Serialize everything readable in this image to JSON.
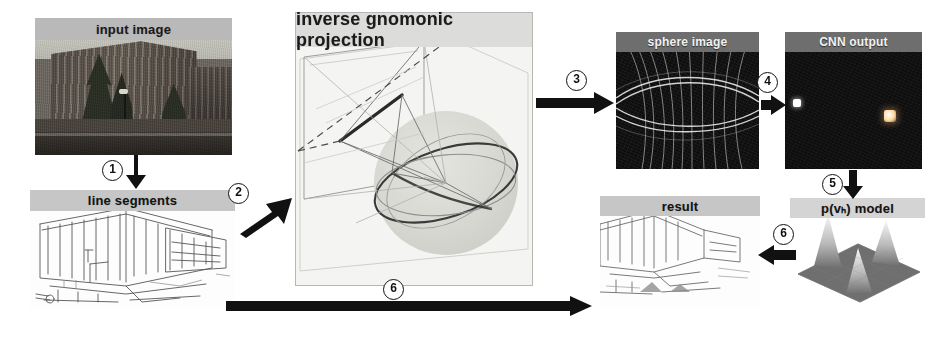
{
  "figure": {
    "type": "pipeline-diagram",
    "background_color": "#ffffff",
    "panels": [
      {
        "id": "input-image",
        "caption": "input image",
        "kind": "photograph",
        "subject": "brick university building with conifer trees and a lamp post",
        "x": 35,
        "y": 18,
        "w": 197,
        "h": 137,
        "caption_band_color": "#b9b9b9",
        "caption_band_height": 22
      },
      {
        "id": "line-segments",
        "caption": "line segments",
        "kind": "line-drawing",
        "subject": "extracted edge / line-segment map of the building",
        "x": 30,
        "y": 190,
        "w": 205,
        "h": 118,
        "caption_band_color": "#c6c6c6",
        "caption_band_height": 21
      },
      {
        "id": "inverse-gnomonic-projection",
        "caption": "inverse gnomonic projection",
        "kind": "3d-geometry",
        "subject": "image plane, projection rays, great circles on the unit sphere",
        "x": 295,
        "y": 12,
        "w": 236,
        "h": 272,
        "caption_band_color": "#dcdcda",
        "caption_band_height": 34
      },
      {
        "id": "sphere-image",
        "caption": "sphere image",
        "kind": "dark-raster",
        "subject": "great-circle traces rendered on an equirectangular sphere image",
        "x": 616,
        "y": 32,
        "w": 143,
        "h": 137,
        "caption_band_color": "#6e6e6e",
        "caption_band_height": 20
      },
      {
        "id": "cnn-output",
        "caption": "CNN output",
        "kind": "dark-raster",
        "subject": "sparse activation heat map with two bright response blobs",
        "x": 785,
        "y": 32,
        "w": 137,
        "h": 137,
        "caption_band_color": "#6e6e6e",
        "caption_band_height": 20,
        "hotspots": [
          {
            "label": "left-response",
            "x": 0.06,
            "y": 0.49,
            "w": 0.055,
            "h": 0.06,
            "color": "#ffffff"
          },
          {
            "label": "right-response",
            "x": 0.72,
            "y": 0.57,
            "w": 0.085,
            "h": 0.085,
            "color": "#ffd8a0"
          }
        ]
      },
      {
        "id": "pvh-model",
        "caption": "p(vₕ) model",
        "kind": "surface-plot",
        "subject": "3-D probability density surface with three gaussian peaks",
        "x": 790,
        "y": 198,
        "w": 135,
        "h": 110,
        "caption_band_color": "#d4d4d4",
        "caption_band_height": 20,
        "peaks": 3
      },
      {
        "id": "result",
        "caption": "result",
        "kind": "line-drawing",
        "subject": "line segments coloured by assigned vanishing point",
        "x": 600,
        "y": 196,
        "w": 160,
        "h": 112,
        "caption_band_color": "#c6c6c6",
        "caption_band_height": 20
      }
    ],
    "steps": [
      {
        "n": "①",
        "label": "1",
        "from": "input-image",
        "to": "line-segments",
        "direction": "down",
        "badge_x": 112,
        "badge_y": 160
      },
      {
        "n": "②",
        "label": "2",
        "from": "line-segments",
        "to": "inverse-gnomonic-projection",
        "direction": "up-right",
        "badge_x": 228,
        "badge_y": 183
      },
      {
        "n": "③",
        "label": "3",
        "from": "inverse-gnomonic-projection",
        "to": "sphere-image",
        "direction": "right",
        "badge_x": 575,
        "badge_y": 76
      },
      {
        "n": "④",
        "label": "4",
        "from": "sphere-image",
        "to": "cnn-output",
        "direction": "right",
        "badge_x": 763,
        "badge_y": 78
      },
      {
        "n": "⑤",
        "label": "5",
        "from": "cnn-output",
        "to": "pvh-model",
        "direction": "down",
        "badge_x": 828,
        "badge_y": 176
      },
      {
        "n": "⑥",
        "label": "6",
        "from": "pvh-model",
        "to": "result",
        "direction": "left",
        "badge_x": 781,
        "badge_y": 232
      },
      {
        "n": "⑥",
        "label": "6",
        "from": "line-segments",
        "to": "result",
        "direction": "right",
        "badge_x": 392,
        "badge_y": 281
      }
    ],
    "colors": {
      "ink": "#111111",
      "arrow": "#111111",
      "caption_dark_band": "#b9b9b9",
      "caption_black_band": "#6e6e6e",
      "panel_bg_light": "#f4f4f2",
      "panel_bg_dark": "#0e0e0e",
      "highlight_warm": "#ffd8a0"
    }
  }
}
